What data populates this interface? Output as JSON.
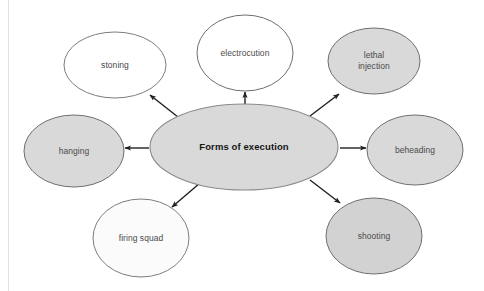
{
  "diagram": {
    "type": "spider-map",
    "title": "Forms of execution",
    "center": {
      "id": "center",
      "label": "Forms of execution",
      "shape": "ellipse",
      "fill": "#d9d9d9",
      "stroke": "#8a8a8a",
      "cx": 244,
      "cy": 147,
      "rx": 94,
      "ry": 43,
      "bold": true
    },
    "nodes": [
      {
        "id": "stoning",
        "label": "stoning",
        "shape": "ellipse",
        "fill": "#ffffff",
        "stroke": "#7d7d7d",
        "cx": 115,
        "cy": 65,
        "rx": 51,
        "ry": 33
      },
      {
        "id": "electrocution",
        "label": "electrocution",
        "shape": "ellipse",
        "fill": "#ffffff",
        "stroke": "#6f6f6f",
        "cx": 245,
        "cy": 53,
        "rx": 48,
        "ry": 38
      },
      {
        "id": "lethal-injection",
        "label": "lethal\ninjection",
        "shape": "ellipse",
        "fill": "#d9d9d9",
        "stroke": "#6f6f6f",
        "cx": 374,
        "cy": 61,
        "rx": 46,
        "ry": 33
      },
      {
        "id": "beheading",
        "label": "beheading",
        "shape": "ellipse",
        "fill": "#d9d9d9",
        "stroke": "#6f6f6f",
        "cx": 415,
        "cy": 150,
        "rx": 48,
        "ry": 35
      },
      {
        "id": "shooting",
        "label": "shooting",
        "shape": "ellipse",
        "fill": "#d2d2d2",
        "stroke": "#6f6f6f",
        "cx": 374,
        "cy": 236,
        "rx": 48,
        "ry": 38
      },
      {
        "id": "firing-squad",
        "label": "firing squad",
        "shape": "ellipse",
        "fill": "#fbfbfb",
        "stroke": "#7d7d7d",
        "cx": 141,
        "cy": 238,
        "rx": 48,
        "ry": 39
      },
      {
        "id": "hanging",
        "label": "hanging",
        "shape": "ellipse",
        "fill": "#d9d9d9",
        "stroke": "#6f6f6f",
        "cx": 74,
        "cy": 151,
        "rx": 50,
        "ry": 36
      }
    ],
    "edges": [
      {
        "id": "edge-stoning",
        "from": "center",
        "to": "stoning",
        "x1": 178,
        "y1": 117,
        "x2": 150,
        "y2": 95,
        "arrow": "end"
      },
      {
        "id": "edge-electrocution",
        "from": "center",
        "to": "electrocution",
        "x1": 245,
        "y1": 104,
        "x2": 245,
        "y2": 92,
        "arrow": "end"
      },
      {
        "id": "edge-lethal-injection",
        "from": "center",
        "to": "lethal-injection",
        "x1": 310,
        "y1": 116,
        "x2": 339,
        "y2": 94,
        "arrow": "end"
      },
      {
        "id": "edge-beheading",
        "from": "center",
        "to": "beheading",
        "x1": 340,
        "y1": 148,
        "x2": 366,
        "y2": 148,
        "arrow": "end"
      },
      {
        "id": "edge-shooting",
        "from": "center",
        "to": "shooting",
        "x1": 310,
        "y1": 180,
        "x2": 340,
        "y2": 203,
        "arrow": "end"
      },
      {
        "id": "edge-firing-squad",
        "from": "center",
        "to": "firing-squad",
        "x1": 200,
        "y1": 183,
        "x2": 172,
        "y2": 207,
        "arrow": "end"
      },
      {
        "id": "edge-hanging",
        "from": "center",
        "to": "hanging",
        "x1": 149,
        "y1": 148,
        "x2": 125,
        "y2": 148,
        "arrow": "end"
      }
    ],
    "style": {
      "background": "#ffffff",
      "arrow_color": "#20201f",
      "label_color": "#4a4a4c",
      "center_label_color": "#161616",
      "left_rule_color": "#e2e2e4"
    }
  }
}
